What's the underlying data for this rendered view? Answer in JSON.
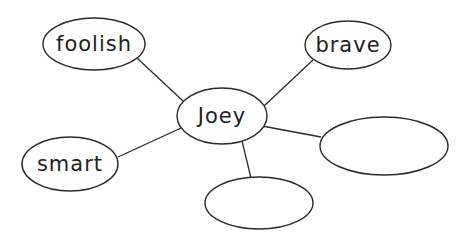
{
  "diagram": {
    "type": "word-web",
    "center": {
      "id": "joey",
      "label": "Joey",
      "cx": 222,
      "cy": 116,
      "rx": 45,
      "ry": 28
    },
    "nodes": [
      {
        "id": "foolish",
        "label": "foolish",
        "cx": 94,
        "cy": 44,
        "rx": 51,
        "ry": 26
      },
      {
        "id": "brave",
        "label": "brave",
        "cx": 348,
        "cy": 45,
        "rx": 43,
        "ry": 24
      },
      {
        "id": "smart",
        "label": "smart",
        "cx": 70,
        "cy": 164,
        "rx": 48,
        "ry": 27
      },
      {
        "id": "blank-right",
        "label": "",
        "cx": 384,
        "cy": 146,
        "rx": 64,
        "ry": 29
      },
      {
        "id": "blank-bottom",
        "label": "",
        "cx": 259,
        "cy": 203,
        "rx": 54,
        "ry": 26
      }
    ],
    "edges": [
      {
        "from": "foolish",
        "to": "joey",
        "x1": 137,
        "y1": 58,
        "x2": 183,
        "y2": 101
      },
      {
        "from": "brave",
        "to": "joey",
        "x1": 313,
        "y1": 60,
        "x2": 264,
        "y2": 106
      },
      {
        "from": "smart",
        "to": "joey",
        "x1": 118,
        "y1": 157,
        "x2": 181,
        "y2": 128
      },
      {
        "from": "joey",
        "to": "blank-right",
        "x1": 262,
        "y1": 126,
        "x2": 321,
        "y2": 137
      },
      {
        "from": "joey",
        "to": "blank-bottom",
        "x1": 242,
        "y1": 141,
        "x2": 251,
        "y2": 178
      }
    ],
    "colors": {
      "stroke": "#2a2a2a",
      "text": "#222222",
      "background": "#ffffff"
    }
  }
}
